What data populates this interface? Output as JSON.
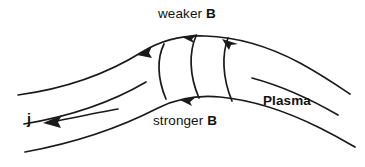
{
  "figure": {
    "background_color": "#ffffff",
    "stroke_color": "#1a1a1a",
    "labels": {
      "weaker_prefix": "weaker",
      "weaker_vector": "B",
      "stronger_prefix": "stronger",
      "stronger_vector": "B",
      "plasma": "Plasma",
      "current": "j"
    },
    "annotations": {
      "field_direction": "arrowheads point to the right along the upper field lines",
      "current_direction": "arrow points to the left",
      "cross_sections": 3
    }
  }
}
